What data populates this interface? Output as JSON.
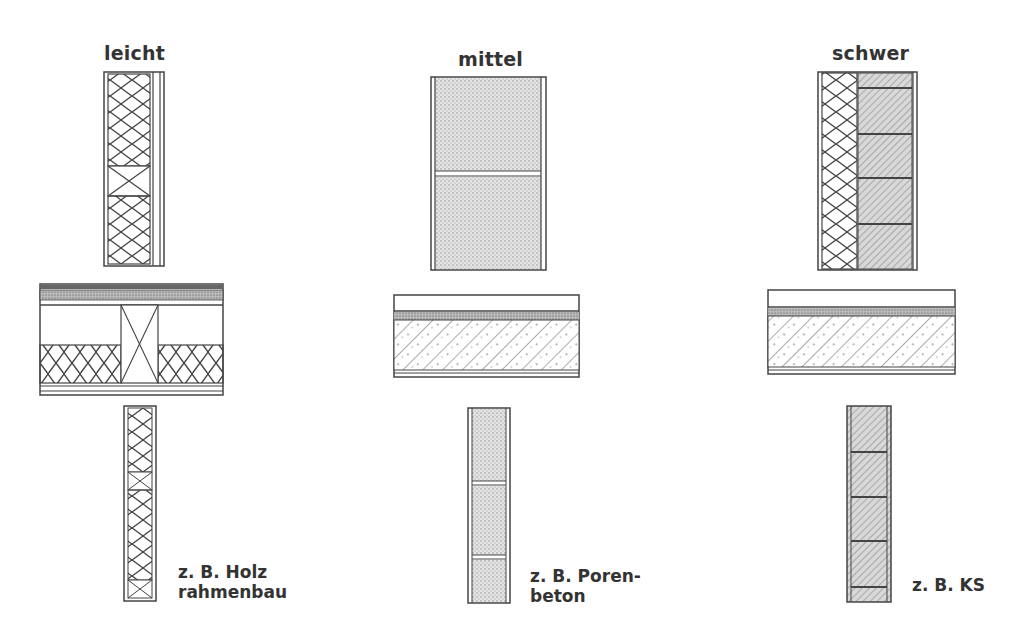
{
  "columns": [
    {
      "id": "light",
      "title": "leicht",
      "example_line1": "z. B. Holz",
      "example_line2": "rahmenbau"
    },
    {
      "id": "medium",
      "title": "mittel",
      "example_line1": "z. B. Poren-",
      "example_line2": "beton"
    },
    {
      "id": "heavy",
      "title": "schwer",
      "example_line1": "z. B. KS",
      "example_line2": ""
    }
  ],
  "colors": {
    "line": "#444444",
    "fill_light": "#dddddd",
    "background": "#ffffff"
  }
}
